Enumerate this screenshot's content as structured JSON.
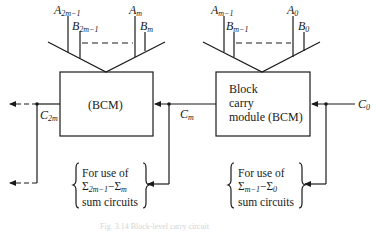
{
  "diagram": {
    "type": "block carry module cascade",
    "left_module": {
      "label": "(BCM)",
      "inputs_top": {
        "a_hi": {
          "base": "A",
          "sub": "2m−1"
        },
        "b_hi": {
          "base": "B",
          "sub": "2m−1"
        },
        "a_lo": {
          "base": "A",
          "sub": "m"
        },
        "b_lo": {
          "base": "B",
          "sub": "m"
        }
      },
      "carry_out": {
        "base": "C",
        "sub": "2m"
      },
      "note": {
        "line1": "For use of",
        "line2_a": "Σ",
        "line2_a_sub": "2m−1",
        "line2_dash": "−",
        "line2_b": "Σ",
        "line2_b_sub": "m",
        "line3": "sum circuits"
      }
    },
    "right_module": {
      "label_lines": [
        "Block",
        "carry",
        "module (BCM)"
      ],
      "inputs_top": {
        "a_hi": {
          "base": "A",
          "sub": "m−1"
        },
        "b_hi": {
          "base": "B",
          "sub": "m−1"
        },
        "a_lo": {
          "base": "A",
          "sub": "0"
        },
        "b_lo": {
          "base": "B",
          "sub": "0"
        }
      },
      "carry_out": {
        "base": "C",
        "sub": "m"
      },
      "carry_in": {
        "base": "C",
        "sub": "0"
      },
      "note": {
        "line1": "For use of",
        "line2_a": "Σ",
        "line2_a_sub": "m−1",
        "line2_dash": "−",
        "line2_b": "Σ",
        "line2_b_sub": "0",
        "line3": "sum circuits"
      }
    },
    "caption": "Fig. 3.14  Block-level carry circuit",
    "colors": {
      "line": "#1a1a1a",
      "caption": "#d4d4d4"
    }
  }
}
